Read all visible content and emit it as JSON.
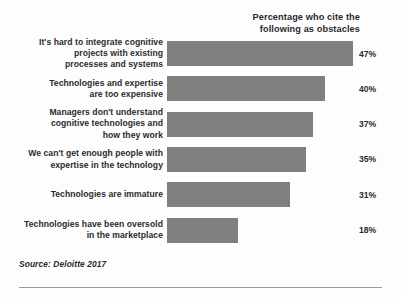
{
  "caption": {
    "line1": "Percentage who cite the",
    "line2": "following as obstacles"
  },
  "source": {
    "text": "Source: Deloitte 2017"
  },
  "chart_data": {
    "type": "bar",
    "orientation": "horizontal",
    "title": "",
    "subtitle": "Percentage who cite the following as obstacles",
    "xlabel": "",
    "ylabel": "",
    "xlim": [
      0,
      50
    ],
    "grid": false,
    "legend": "none",
    "bar_color": "#7f7f7f",
    "value_suffix": "%",
    "categories": [
      "It's hard to integrate cognitive projects with existing processes and systems",
      "Technologies and expertise are too expensive",
      "Managers don't understand cognitive technologies and how they work",
      "We can't get enough people with expertise in the technology",
      "Technologies are immature",
      "Technologies have been oversold in the marketplace"
    ],
    "values": [
      47,
      40,
      37,
      35,
      31,
      18
    ],
    "value_labels": [
      "47%",
      "40%",
      "37%",
      "35%",
      "31%",
      "18%"
    ],
    "bars": [
      {
        "label_lines": [
          "It's hard to integrate cognitive",
          "projects with existing",
          "processes and systems"
        ],
        "value": 47,
        "value_label": "47%"
      },
      {
        "label_lines": [
          "Technologies and expertise",
          "are too expensive"
        ],
        "value": 40,
        "value_label": "40%"
      },
      {
        "label_lines": [
          "Managers don't understand",
          "cognitive technologies and",
          "how they work"
        ],
        "value": 37,
        "value_label": "37%"
      },
      {
        "label_lines": [
          "We can't get enough people with",
          "expertise in the technology"
        ],
        "value": 35,
        "value_label": "35%"
      },
      {
        "label_lines": [
          "Technologies are immature"
        ],
        "value": 31,
        "value_label": "31%"
      },
      {
        "label_lines": [
          "Technologies have been oversold",
          "in the marketplace"
        ],
        "value": 18,
        "value_label": "18%"
      }
    ]
  }
}
